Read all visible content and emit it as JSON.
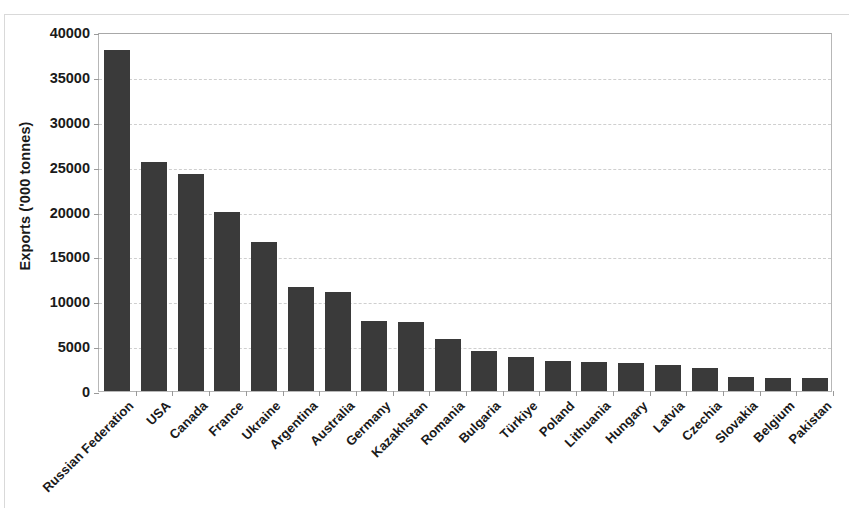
{
  "chart_data": {
    "type": "bar",
    "title": "",
    "subtitle": "",
    "xlabel": "",
    "ylabel": "Exports ('000 tonnes)",
    "ylim": [
      0,
      40000
    ],
    "ytick_step": 5000,
    "yticks": [
      "0",
      "5000",
      "10000",
      "15000",
      "20000",
      "25000",
      "30000",
      "35000",
      "40000"
    ],
    "ytick_values": [
      0,
      5000,
      10000,
      15000,
      20000,
      25000,
      30000,
      35000,
      40000
    ],
    "grid": true,
    "grid_axis": "y",
    "grid_style": "dashed",
    "legend": false,
    "legend_position": "none",
    "bar_color": "#3a3a3a",
    "categories": [
      "Russian Federation",
      "USA",
      "Canada",
      "France",
      "Ukraine",
      "Argentina",
      "Australia",
      "Germany",
      "Kazakhstan",
      "Romania",
      "Bulgaria",
      "Türkiye",
      "Poland",
      "Lithuania",
      "Hungary",
      "Latvia",
      "Czechia",
      "Slovakia",
      "Belgium",
      "Pakistan"
    ],
    "values": [
      38000,
      25500,
      24200,
      19900,
      16600,
      11600,
      11000,
      7800,
      7700,
      5800,
      4500,
      3750,
      3300,
      3250,
      3100,
      2900,
      2600,
      1550,
      1500,
      1500
    ]
  }
}
